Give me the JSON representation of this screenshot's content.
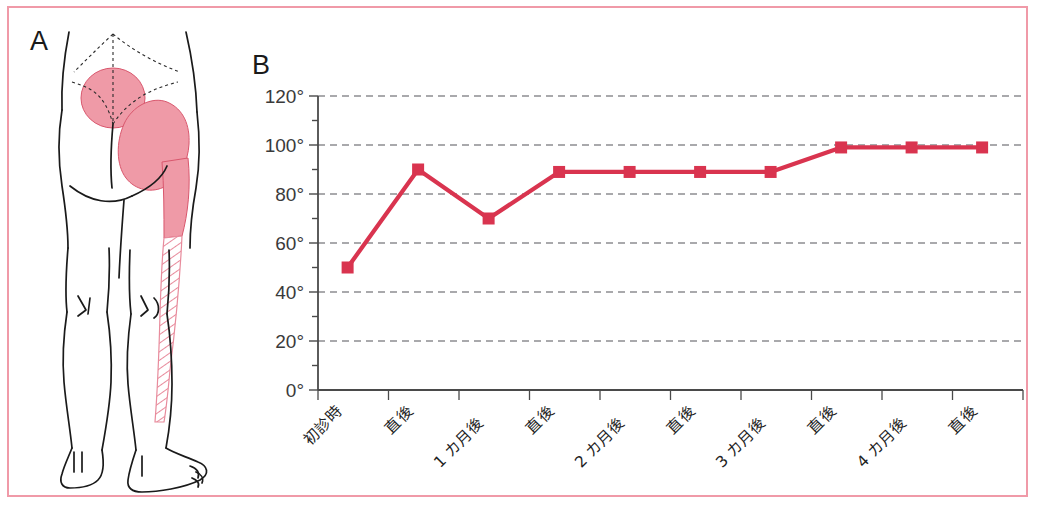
{
  "figure": {
    "frame_color": "#f09aa8",
    "background": "#ffffff",
    "panel_a_letter": "A",
    "panel_b_letter": "B"
  },
  "panel_a": {
    "name": "pain-distribution-diagram",
    "view": "posterior lower body",
    "outline_color": "#1a1a1a",
    "shade_fill": "#ef9aa7",
    "shade_stroke": "#d9576d",
    "regions": [
      {
        "id": "sacral-region",
        "label": "sacral",
        "style": "solid"
      },
      {
        "id": "gluteal-region",
        "label": "gluteal",
        "style": "solid"
      },
      {
        "id": "posterior-thigh-region",
        "label": "posterior thigh",
        "style": "solid"
      },
      {
        "id": "posterior-calf-region",
        "label": "posterior calf",
        "style": "hatched"
      }
    ]
  },
  "chart_data": {
    "type": "line",
    "title": "",
    "xlabel": "",
    "ylabel": "",
    "ylim": [
      0,
      120
    ],
    "y_major_step": 20,
    "y_minor_step": 10,
    "grid": true,
    "grid_axis": "y",
    "grid_style": "dashed",
    "legend": "none",
    "series_color": "#d9344f",
    "marker": "square",
    "y_tick_labels": [
      "0°",
      "20°",
      "40°",
      "60°",
      "80°",
      "100°",
      "120°"
    ],
    "y_tick_values": [
      0,
      20,
      40,
      60,
      80,
      100,
      120
    ],
    "categories": [
      "初診時",
      "直後",
      "1 カ月後",
      "直後",
      "2 カ月後",
      "直後",
      "3 カ月後",
      "直後",
      "4 カ月後",
      "直後"
    ],
    "values": [
      50,
      90,
      70,
      89,
      89,
      89,
      89,
      99,
      99,
      99
    ],
    "series": [
      {
        "name": "SLR angle",
        "values": [
          50,
          90,
          70,
          89,
          89,
          89,
          89,
          99,
          99,
          99
        ]
      }
    ]
  }
}
